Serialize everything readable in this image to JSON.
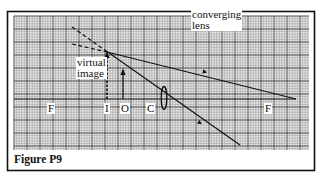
{
  "figure": {
    "caption": "Figure P9",
    "grid": {
      "x0": 14,
      "y0": 16,
      "x1": 309,
      "y1": 150,
      "minor_step": 2.6,
      "major_step": 13
    },
    "frame": {
      "x0": 7,
      "y0": 11,
      "x1": 315,
      "y1": 171
    }
  },
  "labels": {
    "converging_lens": [
      "converging",
      "lens"
    ],
    "virtual_image": [
      "virtual",
      "image"
    ],
    "focal_left": "F",
    "image_point": "I",
    "object_point": "O",
    "center": "C",
    "focal_right": "F"
  },
  "geometry": {
    "axis_y": 99,
    "axis_x_start": 14,
    "axis_x_end": 296,
    "lens": {
      "cx": 164,
      "cy": 98,
      "rx": 2.8,
      "ry": 11.5
    },
    "object_arrow": {
      "x": 123,
      "y_base": 99,
      "y_tip": 69
    },
    "image_arrow": {
      "x": 107,
      "y_base": 99,
      "y_tip": 52
    },
    "rays": [
      {
        "name": "ray-through-center",
        "points": [
          [
            72,
            27
          ],
          [
            240,
            145
          ]
        ],
        "dashed_until_x": 107,
        "arrow_at": [
          200,
          123
        ]
      },
      {
        "name": "ray-parallel-refracted",
        "dashed": [
          [
            72,
            44
          ],
          [
            107,
            52
          ]
        ],
        "solid": [
          [
            107,
            52
          ],
          [
            296,
            99
          ]
        ],
        "arrow_at": [
          205,
          72
        ]
      }
    ]
  },
  "colors": {
    "ink": "#111111",
    "grid_minor": "#9a9a9a",
    "grid_major": "#3a3a3a",
    "background": "#ffffff"
  }
}
